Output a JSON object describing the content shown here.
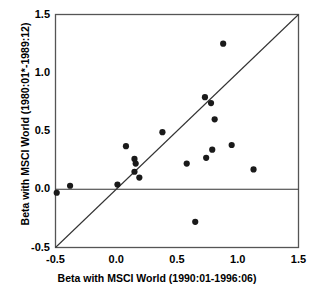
{
  "chart_data": {
    "type": "scatter",
    "title": "",
    "xlabel": "Beta  with  MSCI  World  (1990:01-1996:06)",
    "ylabel": "Beta with MSCI World (1980:01*-1989:12)",
    "xlim": [
      -0.5,
      1.5
    ],
    "ylim": [
      -0.5,
      1.5
    ],
    "xticks": [
      "-0.5",
      "0.0",
      "0.5",
      "1.0",
      "1.5"
    ],
    "xtick_values": [
      -0.5,
      0.0,
      0.5,
      1.0,
      1.5
    ],
    "yticks": [
      "-0.5",
      "0.0",
      "0.5",
      "1.0",
      "1.5"
    ],
    "ytick_values": [
      -0.5,
      0.0,
      0.5,
      1.0,
      1.5
    ],
    "grid": false,
    "legend": "none",
    "marker": "filled-circle",
    "marker_color": "#1a1a1a",
    "marker_size": 5,
    "reference_lines": [
      {
        "name": "identity-line",
        "type": "diagonal",
        "from": [
          -0.5,
          -0.5
        ],
        "to": [
          1.5,
          1.5
        ],
        "color": "#333333"
      },
      {
        "name": "zero-line",
        "type": "horizontal",
        "y": 0.0,
        "color": "#333333"
      }
    ],
    "points": [
      {
        "x": -0.49,
        "y": -0.03
      },
      {
        "x": -0.38,
        "y": 0.03
      },
      {
        "x": 0.01,
        "y": 0.04
      },
      {
        "x": 0.08,
        "y": 0.37
      },
      {
        "x": 0.15,
        "y": 0.26
      },
      {
        "x": 0.16,
        "y": 0.22
      },
      {
        "x": 0.15,
        "y": 0.15
      },
      {
        "x": 0.19,
        "y": 0.1
      },
      {
        "x": 0.38,
        "y": 0.49
      },
      {
        "x": 0.58,
        "y": 0.22
      },
      {
        "x": 0.65,
        "y": -0.28
      },
      {
        "x": 0.73,
        "y": 0.79
      },
      {
        "x": 0.74,
        "y": 0.27
      },
      {
        "x": 0.78,
        "y": 0.74
      },
      {
        "x": 0.79,
        "y": 0.34
      },
      {
        "x": 0.81,
        "y": 0.6
      },
      {
        "x": 0.88,
        "y": 1.25
      },
      {
        "x": 0.95,
        "y": 0.38
      },
      {
        "x": 1.13,
        "y": 0.17
      }
    ]
  },
  "axes": {
    "frame_color": "#555555"
  }
}
